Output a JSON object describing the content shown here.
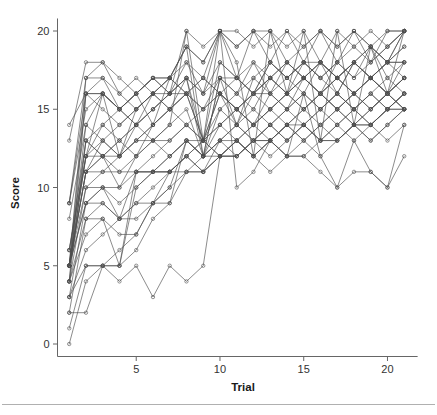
{
  "chart_data": {
    "type": "line",
    "title": "",
    "subtitle": "",
    "xlabel": "Trial",
    "ylabel": "Score",
    "xlim": [
      0.3,
      21.8
    ],
    "ylim": [
      -0.6,
      20.8
    ],
    "xticks": [
      5,
      10,
      15,
      20
    ],
    "xticklabels": [
      "5",
      "10",
      "15",
      "20"
    ],
    "yticks": [
      0,
      5,
      10,
      15,
      20
    ],
    "yticklabels": [
      "0",
      "5",
      "10",
      "15",
      "20"
    ],
    "grid": false,
    "legend": false,
    "legend_position": "none",
    "marker": "open-circle",
    "line_color": "#4d4d4d",
    "x": [
      1,
      2,
      3,
      4,
      5,
      6,
      7,
      8,
      9,
      10,
      11,
      12,
      13,
      14,
      15,
      16,
      17,
      18,
      19,
      20,
      21
    ],
    "series": [
      {
        "name": "subject-01",
        "values": [
          14,
          16,
          16,
          15,
          14,
          15,
          16,
          17,
          16,
          17,
          16,
          17,
          18,
          17,
          18,
          17,
          18,
          19,
          18,
          19,
          20
        ]
      },
      {
        "name": "subject-02",
        "values": [
          13,
          18,
          18,
          17,
          16,
          17,
          17,
          19,
          18,
          20,
          19,
          20,
          19,
          20,
          19,
          20,
          19,
          20,
          19,
          20,
          20
        ]
      },
      {
        "name": "subject-03",
        "values": [
          9,
          17,
          17,
          16,
          15,
          16,
          17,
          16,
          15,
          16,
          17,
          16,
          17,
          18,
          17,
          18,
          17,
          18,
          19,
          18,
          19
        ]
      },
      {
        "name": "subject-04",
        "values": [
          9,
          16,
          15,
          14,
          15,
          16,
          15,
          16,
          17,
          16,
          15,
          16,
          17,
          16,
          17,
          16,
          17,
          16,
          17,
          16,
          17
        ]
      },
      {
        "name": "subject-05",
        "values": [
          8,
          14,
          13,
          12,
          13,
          14,
          15,
          14,
          13,
          14,
          15,
          14,
          15,
          16,
          15,
          16,
          15,
          16,
          15,
          16,
          15
        ]
      },
      {
        "name": "subject-06",
        "values": [
          6,
          13,
          12,
          13,
          14,
          13,
          14,
          20,
          13,
          20,
          18,
          12,
          20,
          16,
          20,
          13,
          20,
          14,
          19,
          16,
          20
        ]
      },
      {
        "name": "subject-07",
        "values": [
          6,
          12,
          14,
          13,
          12,
          13,
          12,
          13,
          12,
          13,
          14,
          13,
          14,
          13,
          14,
          15,
          14,
          15,
          14,
          15,
          16
        ]
      },
      {
        "name": "subject-08",
        "values": [
          5,
          12,
          12,
          10,
          11,
          11,
          11,
          12,
          11,
          12,
          13,
          12,
          13,
          12,
          13,
          12,
          13,
          14,
          13,
          14,
          15
        ]
      },
      {
        "name": "subject-09",
        "values": [
          5,
          11,
          11,
          11,
          11,
          11,
          12,
          13,
          13,
          12,
          12,
          13,
          13,
          14,
          14,
          13,
          13,
          14,
          14,
          15,
          15
        ]
      },
      {
        "name": "subject-10",
        "values": [
          5,
          10,
          10,
          9,
          10,
          11,
          12,
          13,
          12,
          13,
          12,
          13,
          14,
          13,
          14,
          13,
          14,
          15,
          14,
          15,
          16
        ]
      },
      {
        "name": "subject-11",
        "values": [
          5,
          9,
          10,
          8,
          9,
          9,
          11,
          12,
          13,
          12,
          13,
          14,
          13,
          14,
          15,
          14,
          15,
          14,
          15,
          16,
          15
        ]
      },
      {
        "name": "subject-12",
        "values": [
          5,
          9,
          9,
          8,
          8,
          9,
          10,
          11,
          12,
          12,
          13,
          12,
          13,
          14,
          13,
          14,
          13,
          14,
          13,
          14,
          15
        ]
      },
      {
        "name": "subject-13",
        "values": [
          4,
          8,
          8,
          7,
          7,
          9,
          9,
          11,
          11,
          12,
          12,
          13,
          13,
          12,
          12,
          13,
          13,
          14,
          14,
          15,
          15
        ]
      },
      {
        "name": "subject-14",
        "values": [
          4,
          7,
          8,
          5,
          10,
          11,
          11,
          12,
          11,
          12,
          13,
          12,
          13,
          14,
          13,
          14,
          15,
          14,
          15,
          16,
          17
        ]
      },
      {
        "name": "subject-15",
        "values": [
          3,
          6,
          7,
          8,
          9,
          10,
          11,
          12,
          13,
          14,
          13,
          14,
          15,
          14,
          15,
          16,
          15,
          16,
          17,
          16,
          17
        ]
      },
      {
        "name": "subject-16",
        "values": [
          3,
          5,
          5,
          4,
          5,
          3,
          5,
          4,
          5,
          12,
          12,
          13,
          12,
          13,
          14,
          13,
          14,
          13,
          14,
          13,
          14
        ]
      },
      {
        "name": "subject-17",
        "values": [
          2,
          2,
          5,
          5,
          11,
          11,
          11,
          11,
          11,
          13,
          13,
          12,
          11,
          12,
          12,
          11,
          10,
          11,
          11,
          10,
          12
        ]
      },
      {
        "name": "subject-18",
        "values": [
          1,
          5,
          5,
          5,
          6,
          8,
          9,
          13,
          12,
          13,
          14,
          13,
          14,
          15,
          16,
          15,
          16,
          15,
          16,
          15,
          16
        ]
      },
      {
        "name": "subject-19",
        "values": [
          0,
          4,
          5,
          6,
          7,
          9,
          10,
          13,
          12,
          14,
          15,
          14,
          15,
          16,
          17,
          16,
          17,
          16,
          17,
          18,
          19
        ]
      },
      {
        "name": "subject-20",
        "values": [
          9,
          15,
          16,
          15,
          16,
          17,
          17,
          19,
          18,
          20,
          20,
          19,
          20,
          18,
          19,
          20,
          18,
          20,
          19,
          18,
          20
        ]
      },
      {
        "name": "subject-21",
        "values": [
          5,
          16,
          16,
          15,
          16,
          17,
          16,
          18,
          17,
          20,
          17,
          20,
          18,
          20,
          18,
          20,
          19,
          20,
          18,
          20,
          20
        ]
      },
      {
        "name": "subject-22",
        "values": [
          5,
          17,
          18,
          16,
          17,
          16,
          17,
          18,
          16,
          20,
          19,
          20,
          20,
          19,
          20,
          18,
          20,
          19,
          20,
          19,
          20
        ]
      },
      {
        "name": "subject-23",
        "values": [
          4,
          13,
          12,
          11,
          12,
          14,
          15,
          16,
          13,
          16,
          14,
          16,
          16,
          17,
          16,
          18,
          17,
          18,
          17,
          16,
          18
        ]
      },
      {
        "name": "subject-24",
        "values": [
          5,
          11,
          12,
          12,
          13,
          13,
          14,
          15,
          12,
          15,
          16,
          15,
          17,
          16,
          18,
          17,
          16,
          18,
          17,
          18,
          18
        ]
      },
      {
        "name": "subject-25",
        "values": [
          5,
          12,
          16,
          15,
          14,
          16,
          15,
          17,
          16,
          18,
          17,
          18,
          16,
          18,
          17,
          18,
          16,
          18,
          17,
          18,
          17
        ]
      },
      {
        "name": "subject-26",
        "values": [
          5,
          11,
          13,
          14,
          15,
          16,
          17,
          19,
          12,
          17,
          14,
          17,
          16,
          15,
          17,
          16,
          18,
          17,
          19,
          17,
          18
        ]
      },
      {
        "name": "subject-27",
        "values": [
          4,
          10,
          11,
          12,
          13,
          14,
          15,
          16,
          17,
          16,
          15,
          16,
          15,
          16,
          15,
          16,
          15,
          16,
          15,
          16,
          15
        ]
      },
      {
        "name": "subject-28",
        "values": [
          6,
          12,
          13,
          12,
          14,
          15,
          16,
          16,
          13,
          16,
          15,
          14,
          16,
          15,
          16,
          15,
          16,
          15,
          16,
          15,
          16
        ]
      },
      {
        "name": "subject-29",
        "values": [
          5,
          13,
          14,
          15,
          16,
          17,
          16,
          17,
          12,
          17,
          16,
          18,
          17,
          18,
          17,
          18,
          17,
          18,
          17,
          18,
          18
        ]
      },
      {
        "name": "subject-30",
        "values": [
          3,
          9,
          10,
          10,
          12,
          13,
          13,
          14,
          13,
          15,
          14,
          15,
          14,
          15,
          14,
          15,
          16,
          15,
          16,
          17,
          16
        ]
      },
      {
        "name": "subject-31",
        "values": [
          2,
          8,
          9,
          8,
          11,
          12,
          13,
          14,
          15,
          16,
          15,
          16,
          17,
          16,
          17,
          16,
          17,
          16,
          17,
          16,
          17
        ]
      },
      {
        "name": "subject-32",
        "values": [
          5,
          14,
          16,
          12,
          15,
          16,
          16,
          20,
          19,
          20,
          10,
          11,
          13,
          12,
          16,
          12,
          10,
          13,
          11,
          10,
          14
        ]
      },
      {
        "name": "subject-33",
        "values": [
          4,
          16,
          17,
          15,
          16,
          14,
          17,
          16,
          15,
          17,
          17,
          16,
          18,
          17,
          18,
          18,
          17,
          18,
          19,
          18,
          20
        ]
      },
      {
        "name": "subject-34",
        "values": [
          5,
          11,
          12,
          13,
          14,
          15,
          16,
          17,
          13,
          18,
          17,
          16,
          18,
          17,
          18,
          17,
          18,
          17,
          18,
          19,
          20
        ]
      }
    ]
  },
  "axes": {
    "y_label": "Score",
    "x_label": "Trial"
  },
  "ticks": {
    "x": [
      "5",
      "10",
      "15",
      "20"
    ],
    "y": [
      "0",
      "5",
      "10",
      "15",
      "20"
    ]
  }
}
